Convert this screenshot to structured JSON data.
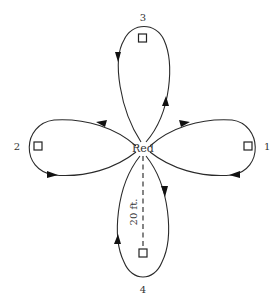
{
  "diagram": {
    "type": "cloverleaf-route-diagram",
    "center": {
      "label": "Red",
      "x": 143,
      "y": 148
    },
    "loops": [
      {
        "id": "1",
        "label": "1",
        "direction": "right",
        "marker": "square"
      },
      {
        "id": "2",
        "label": "2",
        "direction": "left",
        "marker": "square"
      },
      {
        "id": "3",
        "label": "3",
        "direction": "up",
        "marker": "square"
      },
      {
        "id": "4",
        "label": "4",
        "direction": "down",
        "marker": "square"
      }
    ],
    "distance": {
      "label": "20 ft.",
      "from": "Red",
      "to": "4",
      "style": "dashed"
    }
  },
  "colors": {
    "line": "#2a2a2a",
    "text": "#333333",
    "background": "#ffffff"
  }
}
